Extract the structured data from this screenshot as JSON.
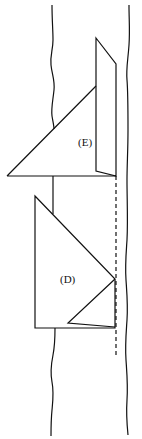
{
  "diagram": {
    "width": 142,
    "height": 439,
    "background": "#ffffff",
    "stroke_color": "#111111",
    "labels": {
      "E": "(E)",
      "D": "(D)"
    }
  }
}
